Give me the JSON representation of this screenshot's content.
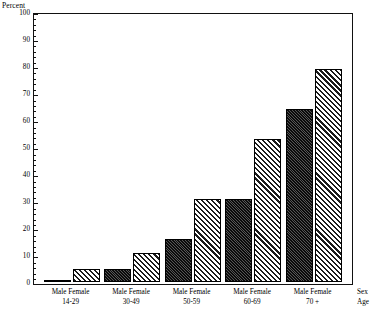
{
  "chart_data": {
    "type": "bar",
    "title": "",
    "xlabel": "Sex / Age",
    "ylabel": "Percent",
    "ylim": [
      0,
      100
    ],
    "ytick_step": 10,
    "grid": false,
    "legend": "none",
    "categories": [
      "14-29",
      "30-49",
      "50-59",
      "60-69",
      "70 +"
    ],
    "series": [
      {
        "name": "Male",
        "values": [
          1,
          5,
          16,
          31,
          64
        ]
      },
      {
        "name": "Female",
        "values": [
          5,
          11,
          31,
          53,
          79
        ]
      }
    ]
  },
  "axes": {
    "y_title": "Percent",
    "y_ticks": [
      "100",
      "90",
      "80",
      "70",
      "60",
      "50",
      "40",
      "30",
      "20",
      "10",
      "0"
    ],
    "x_caption_sex": "Sex",
    "x_caption_age": "Age"
  },
  "groups": [
    {
      "male_label": "Male",
      "female_label": "Female",
      "age_label": "14-29"
    },
    {
      "male_label": "Male",
      "female_label": "Female",
      "age_label": "30-49"
    },
    {
      "male_label": "Male",
      "female_label": "Female",
      "age_label": "50-59"
    },
    {
      "male_label": "Male",
      "female_label": "Female",
      "age_label": "60-69"
    },
    {
      "male_label": "Male",
      "female_label": "Female",
      "age_label": "70 +"
    }
  ],
  "style": {
    "male_color": "#0b0b0b",
    "female_color": "#1a1a1a",
    "axis_color": "#111111",
    "background": "#ffffff"
  }
}
